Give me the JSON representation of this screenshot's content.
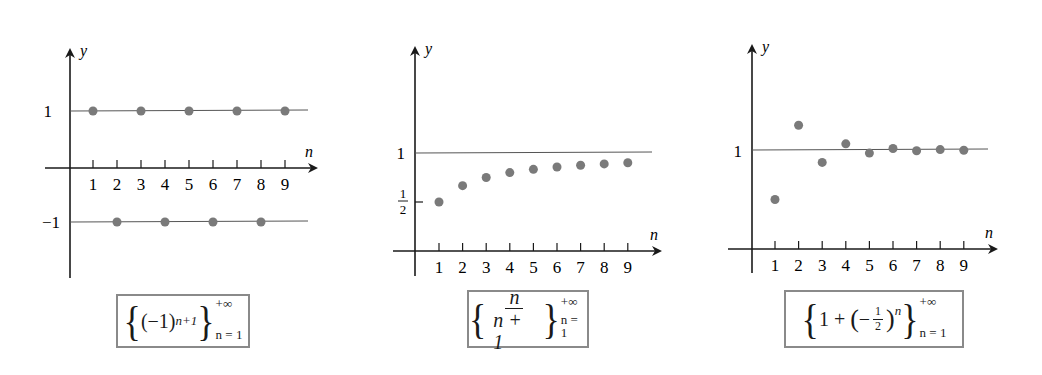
{
  "chart_data": [
    {
      "type": "scatter",
      "title": "{(-1)^(n+1)} n=1 to +∞",
      "xlabel": "n",
      "ylabel": "y",
      "x": [
        1,
        2,
        3,
        4,
        5,
        6,
        7,
        8,
        9
      ],
      "values": [
        1,
        -1,
        1,
        -1,
        1,
        -1,
        1,
        -1,
        1
      ],
      "x_ticks": [
        "1",
        "2",
        "3",
        "4",
        "5",
        "6",
        "7",
        "8",
        "9"
      ],
      "y_ticks": [
        {
          "value": 1,
          "label": "1"
        },
        {
          "value": -1,
          "label": "−1"
        }
      ],
      "reference_lines": [
        1,
        -1
      ],
      "grid": false
    },
    {
      "type": "scatter",
      "title": "{n/(n+1)} n=1 to +∞",
      "xlabel": "n",
      "ylabel": "y",
      "x": [
        1,
        2,
        3,
        4,
        5,
        6,
        7,
        8,
        9
      ],
      "values": [
        0.5,
        0.667,
        0.75,
        0.8,
        0.833,
        0.857,
        0.875,
        0.889,
        0.9
      ],
      "x_ticks": [
        "1",
        "2",
        "3",
        "4",
        "5",
        "6",
        "7",
        "8",
        "9"
      ],
      "y_ticks": [
        {
          "value": 1,
          "label": "1"
        },
        {
          "value": 0.5,
          "label": "1/2"
        }
      ],
      "reference_lines": [
        1
      ],
      "grid": false
    },
    {
      "type": "scatter",
      "title": "{1 + (-1/2)^n} n=1 to +∞",
      "xlabel": "n",
      "ylabel": "y",
      "x": [
        1,
        2,
        3,
        4,
        5,
        6,
        7,
        8,
        9
      ],
      "values": [
        0.5,
        1.25,
        0.875,
        1.0625,
        0.96875,
        1.015625,
        0.9921875,
        1.00390625,
        0.998046875
      ],
      "x_ticks": [
        "1",
        "2",
        "3",
        "4",
        "5",
        "6",
        "7",
        "8",
        "9"
      ],
      "y_ticks": [
        {
          "value": 1,
          "label": "1"
        }
      ],
      "reference_lines": [
        1
      ],
      "grid": false
    }
  ],
  "labels": {
    "y_axis": "y",
    "x_axis": "n",
    "ticks": [
      "1",
      "2",
      "3",
      "4",
      "5",
      "6",
      "7",
      "8",
      "9"
    ],
    "c1_y_pos": "1",
    "c1_y_neg": "−1",
    "c2_y_one": "1",
    "c2_y_half_num": "1",
    "c2_y_half_den": "2",
    "c3_y_one": "1"
  },
  "formulas": [
    {
      "base": "(−1)",
      "exp": "n+1",
      "upper": "+∞",
      "lower": "n = 1"
    },
    {
      "num": "n",
      "den": "n + 1",
      "upper": "+∞",
      "lower": "n = 1"
    },
    {
      "lead": "1 + ",
      "inner_sign": "−",
      "inner_num": "1",
      "inner_den": "2",
      "exp": "n",
      "upper": "+∞",
      "lower": "n = 1"
    }
  ],
  "colors": {
    "point": "#7a7a7a",
    "axis": "#1a1a1a",
    "refline": "#555555",
    "box_border": "#8a8a8a"
  }
}
